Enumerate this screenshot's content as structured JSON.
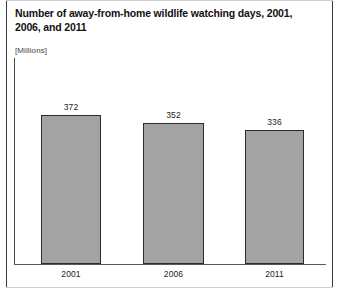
{
  "chart_data": {
    "type": "bar",
    "title": "Number of away-from-home wildlife watching days, 2001, 2006, and 2011",
    "subtitle": "[Millions]",
    "units": "[Millions]",
    "categories": [
      "2001",
      "2006",
      "2011"
    ],
    "values": [
      372,
      352,
      336
    ],
    "value_labels": [
      "372",
      "352",
      "336"
    ],
    "xlabel": "",
    "ylabel": "",
    "ylim": [
      0,
      420
    ],
    "grid": false,
    "legend": null,
    "series": [
      {
        "name": "Away-from-home wildlife watching days",
        "values": [
          372,
          352,
          336
        ]
      }
    ],
    "colors": {
      "bar_fill": "#a3a3a3",
      "bar_border": "#2b2b2b",
      "axis": "#4a4a4a",
      "text": "#1a1a1a",
      "title": "#111111",
      "frame": "#3a3a3a"
    }
  }
}
